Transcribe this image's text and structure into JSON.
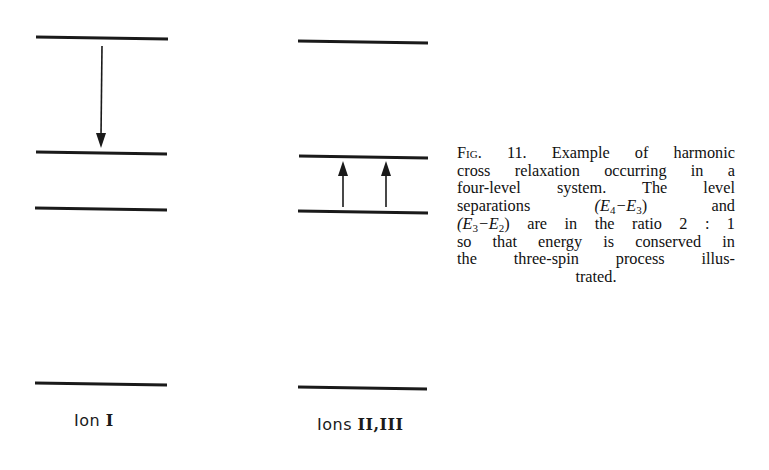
{
  "figure": {
    "number": "11",
    "type": "energy level diagram",
    "groups": [
      {
        "id": "ion-1",
        "label_prefix": "Ion",
        "label_numeral": "I",
        "levels": [
          {
            "name": "E4",
            "y": 38
          },
          {
            "name": "E3",
            "y": 153
          },
          {
            "name": "E2",
            "y": 209
          },
          {
            "name": "E1",
            "y": 384
          }
        ],
        "transitions": [
          {
            "direction": "down",
            "from": "E4",
            "to": "E3",
            "x": 101
          }
        ]
      },
      {
        "id": "ions-2-3",
        "label_prefix": "Ions",
        "label_numeral": "II,III",
        "levels": [
          {
            "name": "E4",
            "y": 42
          },
          {
            "name": "E3",
            "y": 157
          },
          {
            "name": "E2",
            "y": 212
          },
          {
            "name": "E1",
            "y": 388
          }
        ],
        "transitions": [
          {
            "direction": "up",
            "from": "E2",
            "to": "E3",
            "x": 343
          },
          {
            "direction": "up",
            "from": "E2",
            "to": "E3",
            "x": 386
          }
        ]
      }
    ],
    "caption": {
      "fig_label": "Fig. 11.",
      "lines": [
        "Example of harmonic",
        "cross relaxation occurring in a",
        "four-level system. The level",
        "separations (E4 − E3) and",
        "(E3 − E2) are in the ratio 2 : 1",
        "so that energy is conserved in",
        "the three-spin process illus-",
        "trated."
      ],
      "full_text": "Example of harmonic cross relaxation occurring in a four-level system. The level separations (E4−E3) and (E3−E2) are in the ratio 2 : 1 so that energy is conserved in the three-spin process illustrated.",
      "ratio": "2 : 1"
    }
  },
  "labels": {
    "ion1_prefix": "Ion",
    "ion1_numeral": "I",
    "ions23_prefix": "Ions",
    "ions23_numeral": "II,III"
  },
  "caption_parts": {
    "fig": "Fig. 11.",
    "l1": "Example of harmonic",
    "l2": "cross relaxation occurring in a",
    "l3": "four-level system. The level",
    "l4a": "separations",
    "l4b": "(E",
    "l4b_sub": "4",
    "l4c": "−E",
    "l4c_sub": "3",
    "l4d": ")",
    "l4e": "and",
    "l5a": "(E",
    "l5a_sub": "3",
    "l5b": "−E",
    "l5b_sub": "2",
    "l5c": ") are in the ratio 2 : 1",
    "l6": "so that energy is conserved in",
    "l7": "the three-spin process illus-",
    "l8": "trated."
  },
  "colors": {
    "line": "#1a1a1a",
    "background": "#ffffff",
    "text": "#111111"
  }
}
